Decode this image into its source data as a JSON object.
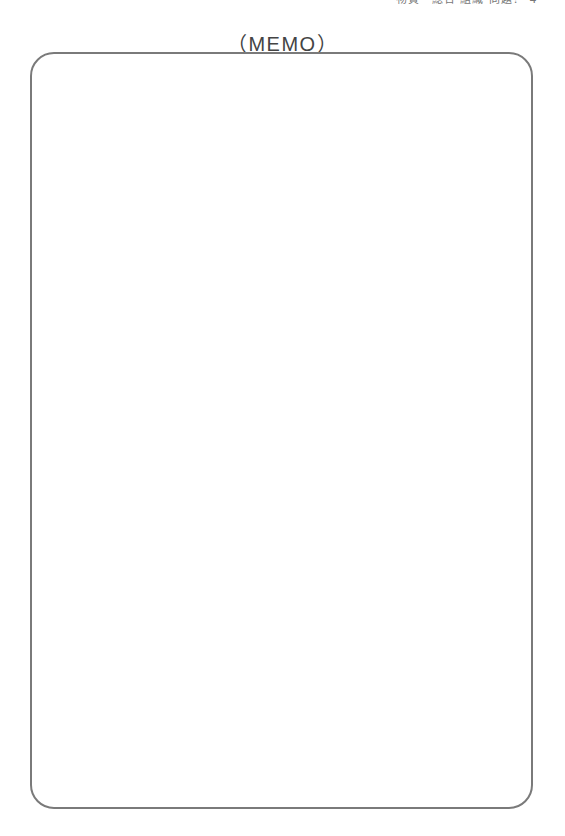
{
  "page": {
    "header_text": "物質・総合 組織 問題？ 4",
    "title": "（MEMO）"
  },
  "memo_box": {
    "content": "",
    "border_color": "#7a7a7a"
  }
}
